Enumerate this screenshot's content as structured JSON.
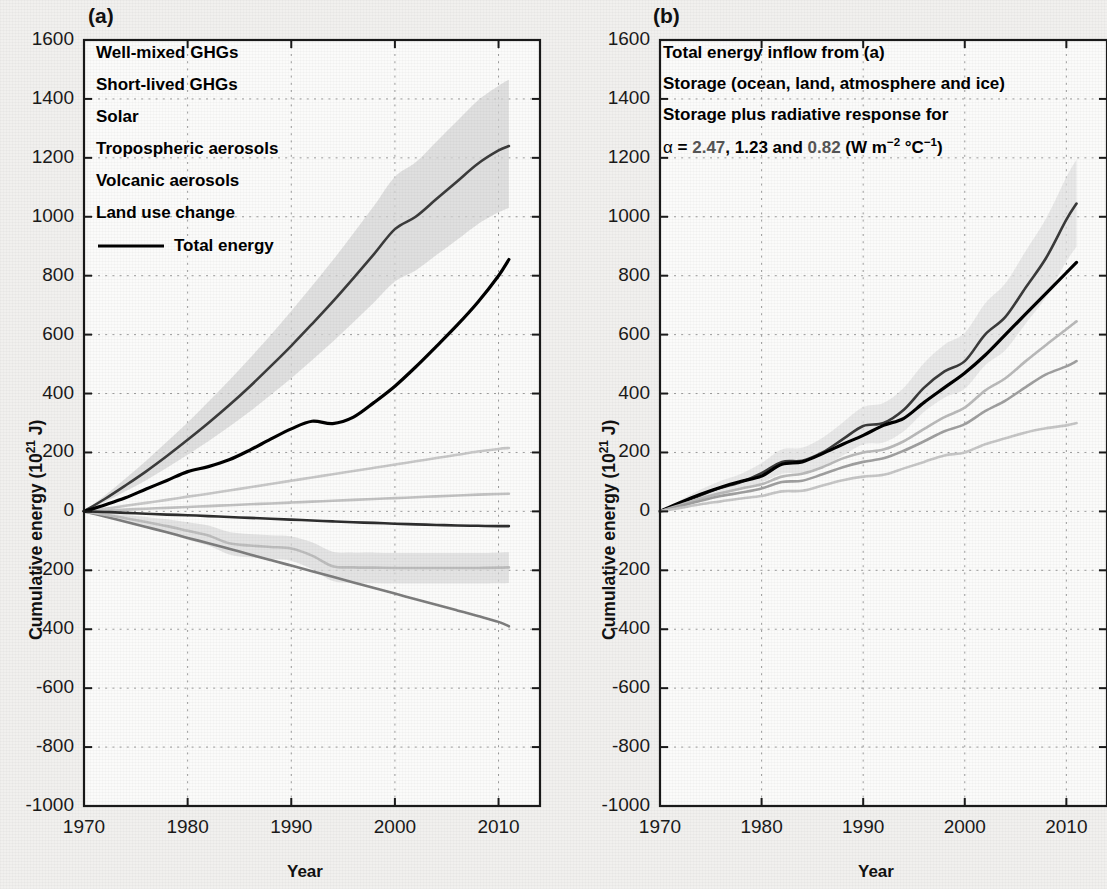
{
  "figure": {
    "background_color": "#f1f0ee",
    "panels": [
      {
        "tag": "(a)",
        "xlabel": "Year",
        "ylabel_prefix": "Cumulative energy (10",
        "ylabel_exp": "21",
        "ylabel_suffix": " J)"
      },
      {
        "tag": "(b)",
        "xlabel": "Year",
        "ylabel_prefix": "Cumulative energy (10",
        "ylabel_exp": "21",
        "ylabel_suffix": " J)"
      }
    ]
  },
  "legend_a": {
    "items": [
      {
        "label": "Well-mixed GHGs",
        "color": "#3b3b3b"
      },
      {
        "label": "Short-lived GHGs",
        "color": "#c8c8c8"
      },
      {
        "label": "Solar",
        "color": "#c2c2c2"
      },
      {
        "label": "Tropospheric aerosols",
        "color": "#7d7d7d"
      },
      {
        "label": "Volcanic aerosols",
        "color": "#bdbdbd"
      },
      {
        "label": "Land use change",
        "color": "#2e2e2e"
      },
      {
        "label": "Total energy",
        "color": "#000000",
        "has_line_sample": true
      }
    ]
  },
  "legend_b": {
    "items": [
      {
        "label": "Total energy inflow from (a)",
        "color": "#000000"
      },
      {
        "label": "Storage (ocean, land, atmosphere and ice)",
        "color": "#b5b5b5"
      },
      {
        "label": "Storage plus radiative response for",
        "color": "#b5b5b5"
      }
    ],
    "alpha_line": {
      "alpha_symbol": "α",
      "text_before": " = ",
      "value1": "2.47",
      "sep1": ", ",
      "value2": "1.23",
      "sep2": " and ",
      "value3": "0.82",
      "units_open": " (W m",
      "units_exp1": "−2",
      "units_mid": " °C",
      "units_exp2": "−1",
      "units_close": ")",
      "color": "#b5b5b5"
    }
  },
  "chart_data": [
    {
      "type": "line",
      "panel": "(a)",
      "title": "Cumulative energy inflow by forcing agent",
      "xlabel": "Year",
      "ylabel": "Cumulative energy (10^21 J)",
      "xlim": [
        1970,
        2014
      ],
      "ylim": [
        -1000,
        1600
      ],
      "xticks": [
        1970,
        1980,
        1990,
        2000,
        2010
      ],
      "yticks": [
        -1000,
        -800,
        -600,
        -400,
        -200,
        0,
        200,
        400,
        600,
        800,
        1000,
        1200,
        1400,
        1600
      ],
      "grid": "dotted",
      "legend_position": "upper-left-inside",
      "x": [
        1970,
        1972,
        1974,
        1976,
        1978,
        1980,
        1982,
        1984,
        1986,
        1988,
        1990,
        1992,
        1994,
        1996,
        1998,
        2000,
        2002,
        2004,
        2006,
        2008,
        2010,
        2011
      ],
      "series": [
        {
          "name": "Well-mixed GHGs",
          "color": "#3b3b3b",
          "values": [
            0,
            42,
            88,
            136,
            188,
            243,
            300,
            360,
            424,
            492,
            562,
            636,
            712,
            792,
            874,
            958,
            1000,
            1060,
            1120,
            1180,
            1225,
            1240
          ],
          "band_lower": [
            0,
            32,
            68,
            106,
            148,
            192,
            238,
            287,
            339,
            395,
            452,
            513,
            576,
            642,
            710,
            780,
            818,
            870,
            922,
            975,
            1015,
            1030
          ],
          "band_upper": [
            0,
            54,
            112,
            172,
            236,
            302,
            372,
            444,
            520,
            598,
            680,
            765,
            852,
            944,
            1038,
            1136,
            1185,
            1255,
            1325,
            1395,
            1445,
            1465
          ],
          "band_color": "#d4d4d4"
        },
        {
          "name": "Short-lived GHGs",
          "color": "#c8c8c8",
          "values": [
            0,
            9,
            19,
            29,
            39,
            50,
            60,
            71,
            82,
            93,
            104,
            115,
            126,
            137,
            148,
            159,
            170,
            181,
            192,
            203,
            212,
            215
          ]
        },
        {
          "name": "Solar",
          "color": "#c2c2c2",
          "values": [
            0,
            3,
            6,
            9,
            12,
            15,
            18,
            21,
            24,
            27,
            30,
            33,
            36,
            39,
            42,
            45,
            48,
            51,
            54,
            57,
            59,
            60
          ]
        },
        {
          "name": "Tropospheric aerosols",
          "color": "#7d7d7d",
          "values": [
            0,
            -17,
            -35,
            -53,
            -71,
            -90,
            -108,
            -127,
            -146,
            -165,
            -184,
            -203,
            -222,
            -241,
            -260,
            -279,
            -298,
            -317,
            -336,
            -355,
            -375,
            -390
          ]
        },
        {
          "name": "Volcanic aerosols",
          "color": "#bdbdbd",
          "values": [
            0,
            -11,
            -23,
            -36,
            -50,
            -66,
            -82,
            -108,
            -116,
            -121,
            -126,
            -150,
            -186,
            -190,
            -191,
            -192,
            -192,
            -192,
            -192,
            -192,
            -191,
            -190
          ],
          "band_lower": [
            0,
            -18,
            -36,
            -54,
            -74,
            -96,
            -116,
            -146,
            -156,
            -162,
            -168,
            -196,
            -236,
            -242,
            -244,
            -245,
            -245,
            -245,
            -245,
            -245,
            -244,
            -243
          ],
          "band_upper": [
            0,
            -5,
            -12,
            -19,
            -27,
            -37,
            -48,
            -70,
            -77,
            -81,
            -85,
            -105,
            -137,
            -140,
            -140,
            -141,
            -141,
            -141,
            -141,
            -141,
            -140,
            -139
          ],
          "band_color": "#d9d9d9"
        },
        {
          "name": "Land use change",
          "color": "#2e2e2e",
          "values": [
            0,
            -2,
            -5,
            -8,
            -11,
            -13,
            -16,
            -19,
            -22,
            -25,
            -28,
            -31,
            -34,
            -37,
            -39,
            -42,
            -44,
            -46,
            -48,
            -49,
            -50,
            -50
          ]
        },
        {
          "name": "Total energy",
          "color": "#000000",
          "values": [
            0,
            22,
            46,
            76,
            105,
            135,
            152,
            175,
            208,
            245,
            280,
            306,
            298,
            320,
            370,
            425,
            490,
            560,
            632,
            710,
            800,
            855
          ]
        }
      ]
    },
    {
      "type": "line",
      "panel": "(b)",
      "title": "Total energy inflow versus storage",
      "xlabel": "Year",
      "ylabel": "Cumulative energy (10^21 J)",
      "xlim": [
        1970,
        2014
      ],
      "ylim": [
        -1000,
        1600
      ],
      "xticks": [
        1970,
        1980,
        1990,
        2000,
        2010
      ],
      "yticks": [
        -1000,
        -800,
        -600,
        -400,
        -200,
        0,
        200,
        400,
        600,
        800,
        1000,
        1200,
        1400,
        1600
      ],
      "grid": "dotted",
      "legend_position": "upper-left-inside",
      "x": [
        1970,
        1972,
        1974,
        1976,
        1978,
        1980,
        1982,
        1984,
        1986,
        1988,
        1990,
        1992,
        1994,
        1996,
        1998,
        2000,
        2002,
        2004,
        2006,
        2008,
        2010,
        2011
      ],
      "series": [
        {
          "name": "Total energy inflow from (a)",
          "color": "#3a3a3a",
          "values": [
            0,
            28,
            55,
            80,
            100,
            130,
            168,
            172,
            200,
            245,
            290,
            300,
            345,
            420,
            475,
            510,
            600,
            660,
            760,
            860,
            990,
            1045
          ],
          "band_lower": [
            0,
            18,
            38,
            58,
            74,
            98,
            128,
            130,
            152,
            190,
            228,
            234,
            272,
            338,
            386,
            416,
            496,
            548,
            638,
            728,
            848,
            898
          ],
          "band_upper": [
            0,
            38,
            74,
            104,
            128,
            164,
            210,
            216,
            250,
            302,
            354,
            368,
            420,
            504,
            566,
            606,
            706,
            774,
            884,
            994,
            1134,
            1194
          ],
          "band_color": "#e0e0e0"
        },
        {
          "name": "Total energy (black)",
          "color": "#000000",
          "values": [
            0,
            30,
            58,
            82,
            102,
            120,
            160,
            168,
            196,
            228,
            258,
            292,
            316,
            370,
            420,
            470,
            530,
            600,
            670,
            740,
            810,
            845
          ]
        },
        {
          "name": "Storage plus radiative response, alpha = 2.47",
          "color": "#b9b9b9",
          "values": [
            0,
            22,
            44,
            62,
            78,
            92,
            118,
            128,
            150,
            180,
            200,
            210,
            238,
            280,
            320,
            352,
            410,
            452,
            510,
            565,
            618,
            645
          ]
        },
        {
          "name": "Storage plus radiative response, alpha = 1.23",
          "color": "#9f9f9f",
          "values": [
            0,
            18,
            36,
            52,
            64,
            78,
            100,
            104,
            126,
            150,
            168,
            180,
            206,
            238,
            272,
            296,
            340,
            376,
            422,
            465,
            492,
            510
          ]
        },
        {
          "name": "Storage (ocean, land, atmosphere and ice)",
          "color": "#c6c6c6",
          "values": [
            0,
            12,
            24,
            34,
            44,
            52,
            68,
            70,
            88,
            106,
            118,
            124,
            146,
            168,
            190,
            200,
            228,
            248,
            268,
            282,
            292,
            300
          ]
        }
      ]
    }
  ]
}
